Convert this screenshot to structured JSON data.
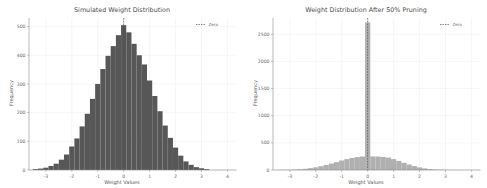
{
  "figure": {
    "background_color": "#ffffff",
    "width": 487,
    "height": 188
  },
  "chart_data": [
    {
      "type": "bar",
      "panel": "left",
      "title": "Simulated Weight Distribution",
      "xlabel": "Weight Values",
      "ylabel": "Frequency",
      "xlim": [
        -3.65,
        4.35
      ],
      "ylim": [
        0,
        530
      ],
      "xticks": [
        -3,
        -2,
        -1,
        0,
        1,
        2,
        3,
        4
      ],
      "yticks": [
        0,
        100,
        200,
        300,
        400,
        500
      ],
      "grid": true,
      "bar_color": "#575757",
      "legend": {
        "position": "upper right",
        "entries": [
          {
            "label": "Zero",
            "style": "dashed-line",
            "color": "#4a4a4a"
          }
        ]
      },
      "bin_edges": [
        -3.5,
        -3.3,
        -3.1,
        -2.9,
        -2.7,
        -2.5,
        -2.3,
        -2.1,
        -1.9,
        -1.7,
        -1.5,
        -1.3,
        -1.1,
        -0.9,
        -0.7,
        -0.5,
        -0.3,
        -0.1,
        0.1,
        0.3,
        0.5,
        0.7,
        0.9,
        1.1,
        1.3,
        1.5,
        1.7,
        1.9,
        2.1,
        2.3,
        2.5,
        2.7,
        2.9,
        3.1,
        3.3
      ],
      "values": [
        3,
        5,
        8,
        14,
        22,
        36,
        54,
        82,
        110,
        152,
        196,
        248,
        300,
        352,
        398,
        432,
        470,
        505,
        480,
        440,
        400,
        368,
        312,
        258,
        205,
        155,
        112,
        78,
        50,
        30,
        18,
        10,
        6,
        3
      ],
      "annotations": [
        {
          "type": "vline",
          "x": 0,
          "label": "Zero",
          "style": "dashed",
          "color": "#4a4a4a"
        }
      ]
    },
    {
      "type": "bar",
      "panel": "right",
      "title": "Weight Distribution After 50% Pruning",
      "xlabel": "Weight Values",
      "ylabel": "Frequency",
      "xlim": [
        -3.65,
        4.35
      ],
      "ylim": [
        0,
        2800
      ],
      "xticks": [
        -3,
        -2,
        -1,
        0,
        1,
        2,
        3,
        4
      ],
      "yticks": [
        0,
        500,
        1000,
        1500,
        2000,
        2500
      ],
      "grid": true,
      "bar_color": "#b0b0b0",
      "legend": {
        "position": "upper right",
        "entries": [
          {
            "label": "Zero",
            "style": "dashed-line",
            "color": "#4a4a4a"
          }
        ]
      },
      "bin_edges": [
        -3.5,
        -3.3,
        -3.1,
        -2.9,
        -2.7,
        -2.5,
        -2.3,
        -2.1,
        -1.9,
        -1.7,
        -1.5,
        -1.3,
        -1.1,
        -0.9,
        -0.7,
        -0.5,
        -0.3,
        -0.1,
        0.1,
        0.3,
        0.5,
        0.7,
        0.9,
        1.1,
        1.3,
        1.5,
        1.7,
        1.9,
        2.1,
        2.3,
        2.5,
        2.7,
        2.9,
        3.1,
        3.3
      ],
      "values": [
        2,
        3,
        5,
        8,
        14,
        22,
        34,
        50,
        70,
        92,
        118,
        145,
        175,
        200,
        222,
        238,
        248,
        2720,
        250,
        248,
        240,
        228,
        200,
        168,
        132,
        100,
        72,
        48,
        30,
        18,
        10,
        6,
        4,
        2
      ],
      "annotations": [
        {
          "type": "vline",
          "x": 0,
          "label": "Zero",
          "style": "dashed",
          "color": "#4a4a4a"
        }
      ]
    }
  ]
}
